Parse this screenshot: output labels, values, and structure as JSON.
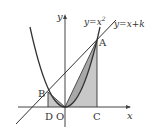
{
  "diagram": {
    "curves": {
      "parabola_label": "y=x²",
      "parabola_label_base": "y=x",
      "parabola_label_exp": "2",
      "line_label": "y=x+k"
    },
    "axes": {
      "x_label": "x",
      "y_label": "y"
    },
    "points": {
      "A": "A",
      "B": "B",
      "C": "C",
      "D": "D",
      "O": "O"
    },
    "colors": {
      "shade": "#c8c8c8",
      "stroke": "#333333",
      "axis": "#444444"
    }
  }
}
